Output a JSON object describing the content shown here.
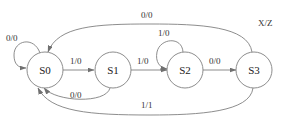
{
  "diagram": {
    "type": "state-transition-diagram",
    "legend": "X/Z",
    "states": [
      {
        "id": "S0",
        "label": "S0"
      },
      {
        "id": "S1",
        "label": "S1"
      },
      {
        "id": "S2",
        "label": "S2"
      },
      {
        "id": "S3",
        "label": "S3"
      }
    ],
    "transitions": [
      {
        "from": "S0",
        "to": "S0",
        "label": "0/0"
      },
      {
        "from": "S0",
        "to": "S1",
        "label": "1/0"
      },
      {
        "from": "S1",
        "to": "S2",
        "label": "1/0"
      },
      {
        "from": "S1",
        "to": "S0",
        "label": "0/0"
      },
      {
        "from": "S2",
        "to": "S2",
        "label": "1/0"
      },
      {
        "from": "S2",
        "to": "S3",
        "label": "0/0"
      },
      {
        "from": "S3",
        "to": "S0",
        "label": "0/0",
        "path": "top"
      },
      {
        "from": "S3",
        "to": "S0",
        "label": "1/1",
        "path": "bottom"
      }
    ]
  }
}
